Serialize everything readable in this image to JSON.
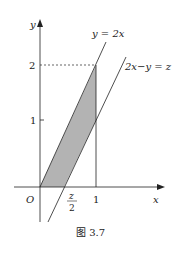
{
  "diagram": {
    "axis_x_label": "x",
    "axis_y_label": "y",
    "origin_label": "O",
    "tick_x_1": "1",
    "tick_y_1": "1",
    "tick_y_2": "2",
    "half_z_num": "z",
    "half_z_den": "2",
    "line1_label": "y = 2x",
    "line2_label": "2x−y = z",
    "shade_color": "#b3b3b3"
  },
  "caption": "图 3.7"
}
